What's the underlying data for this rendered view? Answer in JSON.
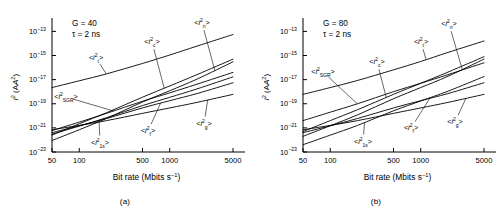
{
  "figure": {
    "caption_a": "(a)",
    "caption_b": "(b)"
  },
  "axes": {
    "xlabel_main": "Bit rate (Mbits s",
    "xlabel_exp": "−1",
    "xlabel_close": ")",
    "ylabel_i": "i",
    "ylabel_i_exp": "2",
    "ylabel_unit_open": " (A",
    "ylabel_unit_exp": "2",
    "ylabel_unit_close": ")",
    "xticks": [
      "50",
      "100",
      "500",
      "1000",
      "5000"
    ],
    "yticks": [
      "10−13",
      "10−15",
      "10−17",
      "10−19",
      "10−21",
      "10−23"
    ],
    "ytick_mantissa": "10",
    "ytick_exponents": [
      "−13",
      "−15",
      "−17",
      "−19",
      "−21",
      "−23"
    ],
    "xlim": [
      50,
      5000
    ],
    "ylim_exp": [
      -23,
      -12.2
    ],
    "xscale": "log",
    "yscale": "log",
    "grid": false
  },
  "panels": [
    {
      "id": "a",
      "annotation_gain_symbol": "G",
      "annotation_gain": "G = 40",
      "annotation_tau": "τ = 2 ns",
      "caption": "(a)",
      "gain": 40,
      "tau_ns": 2
    },
    {
      "id": "b",
      "annotation_gain_symbol": "G",
      "annotation_gain": "G = 80",
      "annotation_tau": "τ = 2 ns",
      "caption": "(b)",
      "gain": 80,
      "tau_ns": 2
    }
  ],
  "curve_labels": {
    "it": {
      "open": "<",
      "sym": "i",
      "sup": "2",
      "sub": "t",
      "close": ">"
    },
    "ic": {
      "open": "<",
      "sym": "i",
      "sup": "2",
      "sub": "c",
      "close": ">"
    },
    "in": {
      "open": "<",
      "sym": "i",
      "sup": "2",
      "sub": "n",
      "close": ">"
    },
    "isgr": {
      "open": "<",
      "sym": "i",
      "sup": "2",
      "sub": "SGR",
      "close": ">"
    },
    "isu": {
      "open": "<",
      "sym": "i",
      "sup": "2",
      "sub": "1s",
      "close": ">"
    },
    "iff": {
      "open": "<",
      "sym": "i",
      "sup": "2",
      "sub": "f",
      "close": ">"
    },
    "ig": {
      "open": "<",
      "sym": "i",
      "sup": "2",
      "sub": "g",
      "close": ">"
    }
  },
  "chart_data": {
    "type": "line",
    "title": "",
    "xlabel": "Bit rate (Mbits s−1)",
    "ylabel": "i2 (A2)",
    "xscale": "log",
    "yscale": "log",
    "xlim": [
      50,
      5000
    ],
    "ylim": [
      1e-23,
      6e-13
    ],
    "xticks": [
      50,
      100,
      500,
      1000,
      5000
    ],
    "yticks": [
      1e-13,
      1e-15,
      1e-17,
      1e-19,
      1e-21,
      1e-23
    ],
    "grid": false,
    "legend": "inline-annotations",
    "panels": [
      {
        "panel": "a",
        "annotations": [
          "G = 40",
          "τ = 2 ns"
        ],
        "x": [
          50,
          100,
          200,
          500,
          1000,
          2000,
          5000
        ],
        "series": [
          {
            "name": "<i2_t>",
            "label_key": "it",
            "values": [
              2.2e-18,
              8e-18,
              3e-17,
              2.2e-16,
              1.1e-15,
              6e-15,
              5.5e-14
            ]
          },
          {
            "name": "<i2_c>",
            "label_key": "ic",
            "values": [
              2.5e-22,
              2.2e-21,
              1.8e-20,
              3.5e-19,
              3e-18,
              2.6e-17,
              5e-16
            ]
          },
          {
            "name": "<i2_n>",
            "label_key": "in",
            "values": [
              9e-23,
              7e-22,
              6e-21,
              1.4e-19,
              1.2e-18,
              1.1e-17,
              3e-16
            ]
          },
          {
            "name": "<i2_SGR>",
            "label_key": "isgr",
            "values": [
              6e-22,
              3e-21,
              1.6e-20,
              1.6e-19,
              8e-19,
              4.2e-18,
              4e-17
            ]
          },
          {
            "name": "<i2_1s>",
            "label_key": "isu",
            "values": [
              3e-22,
              1.4e-21,
              7e-21,
              7e-20,
              3.4e-19,
              1.7e-18,
              1.7e-17
            ]
          },
          {
            "name": "<i2_f>",
            "label_key": "iff",
            "values": [
              4e-22,
              1.5e-21,
              6e-21,
              4.5e-20,
              1.8e-19,
              7e-19,
              5.5e-18
            ]
          },
          {
            "name": "<i2_g>",
            "label_key": "ig",
            "values": [
              7e-22,
              1.6e-21,
              4e-21,
              1.6e-20,
              4.5e-20,
              1.3e-19,
              6e-19
            ]
          }
        ]
      },
      {
        "panel": "b",
        "annotations": [
          "G = 80",
          "τ = 2 ns"
        ],
        "x": [
          50,
          100,
          200,
          500,
          1000,
          2000,
          5000
        ],
        "series": [
          {
            "name": "<i2_t>",
            "label_key": "it",
            "values": [
              6e-19,
              2.2e-18,
              8.5e-18,
              6.5e-17,
              3.2e-16,
              1.8e-15,
              1.6e-14
            ]
          },
          {
            "name": "<i2_c>",
            "label_key": "ic",
            "values": [
              5e-22,
              4e-21,
              3.2e-20,
              6e-19,
              5e-18,
              4.2e-17,
              8e-16
            ]
          },
          {
            "name": "<i2_n>",
            "label_key": "in",
            "values": [
              2e-22,
              1.5e-21,
              1.2e-20,
              2.6e-19,
              2.2e-18,
              1.9e-17,
              5e-16
            ]
          },
          {
            "name": "<i2_SGR>",
            "label_key": "isgr",
            "values": [
              4e-21,
              2e-20,
              1e-19,
              1e-18,
              5e-18,
              2.6e-17,
              2.5e-16
            ]
          },
          {
            "name": "<i2_1s>",
            "label_key": "isu",
            "values": [
              4e-23,
              2.5e-22,
              1.6e-21,
              2.6e-20,
              1.7e-19,
              1.1e-18,
              1.8e-17
            ]
          },
          {
            "name": "<i2_f>",
            "label_key": "iff",
            "values": [
              4e-22,
              1.5e-21,
              6e-21,
              4.5e-20,
              1.8e-19,
              7e-19,
              5.5e-18
            ]
          },
          {
            "name": "<i2_g>",
            "label_key": "ig",
            "values": [
              7e-22,
              1.6e-21,
              4e-21,
              1.6e-20,
              4.5e-20,
              1.3e-19,
              6e-19
            ]
          }
        ]
      }
    ]
  },
  "style": {
    "line_color": "#000000",
    "axis_color": "#000000",
    "leader_color": "#000000",
    "background": "#ffffff"
  }
}
